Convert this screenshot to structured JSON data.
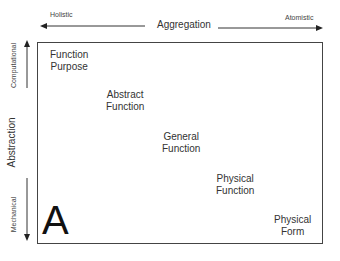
{
  "horizontal_axis": {
    "title": "Aggregation",
    "left_label": "Holistic",
    "right_label": "Atomistic"
  },
  "vertical_axis": {
    "title": "Abstraction",
    "top_label": "Computational",
    "bottom_label": "Mechanical"
  },
  "nodes": [
    {
      "line1": "Function",
      "line2": "Purpose"
    },
    {
      "line1": "Abstract",
      "line2": "Function"
    },
    {
      "line1": "General",
      "line2": "Function"
    },
    {
      "line1": "Physical",
      "line2": "Function"
    },
    {
      "line1": "Physical",
      "line2": "Form"
    }
  ],
  "panel_label": "A"
}
